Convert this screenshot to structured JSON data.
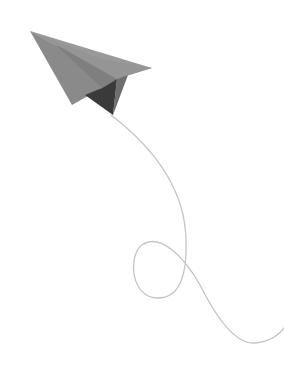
{
  "illustration": {
    "description": "Paper airplane with trailing string",
    "colors": {
      "background": "#ffffff",
      "wing_light": "#8c8c8c",
      "wing_top": "#9a9a9a",
      "fold_mid": "#6e6e6e",
      "keel_dark": "#3a3a3a",
      "trail": "#c4c4c4"
    }
  }
}
